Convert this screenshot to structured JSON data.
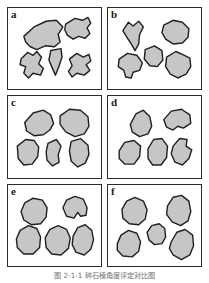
{
  "figure": {
    "title_label": "Roundness / angularity comparison chart",
    "caption": "图 2-1-1  碎石棱角度评定对比图",
    "panel_count": 6,
    "colors": {
      "grain_fill": "#c6c6c6",
      "grain_stroke": "#1f1f1f",
      "panel_border": "#2b2b2b",
      "background": "#ffffff",
      "label_color": "#1a1a1a",
      "caption_color": "#6e6e6e"
    }
  },
  "panels": [
    {
      "id": "a",
      "label": "a",
      "class_name": "very-angular",
      "grain_count": 5,
      "grains": [
        {
          "name": "grain-a1",
          "points": "17,30 28,20 41,14 52,13 59,20 54,28 56,36 50,41 40,40 31,44 24,41 19,36"
        },
        {
          "name": "grain-a2",
          "points": "62,17 72,11 80,13 86,10 89,16 85,21 88,27 83,32 76,30 70,33 64,29 61,23"
        },
        {
          "name": "grain-a3",
          "points": "14,54 21,47 27,50 31,46 36,52 33,59 38,64 35,71 27,69 22,74 17,69 19,62 13,60"
        },
        {
          "name": "grain-a4",
          "points": "46,45 57,43 58,52 55,61 51,71 47,62 44,55"
        },
        {
          "name": "grain-a5",
          "points": "66,54 74,48 81,52 87,49 89,56 84,60 88,66 82,71 74,69 69,73 65,67 69,61"
        }
      ]
    },
    {
      "id": "b",
      "label": "b",
      "class_name": "angular",
      "grain_count": 5,
      "grains": [
        {
          "name": "grain-b1",
          "points": "16,24 22,15 27,19 33,14 38,20 34,28 33,38 29,45 25,38 21,32"
        },
        {
          "name": "grain-b2",
          "points": "60,18 70,13 80,15 87,22 86,31 80,37 70,38 62,33 58,26"
        },
        {
          "name": "grain-b3",
          "points": "40,44 50,40 58,45 59,55 53,62 45,61 39,54"
        },
        {
          "name": "grain-b4",
          "points": "12,54 21,48 31,50 37,58 34,66 27,68 25,74 19,73 17,66 11,62"
        },
        {
          "name": "grain-b5",
          "points": "63,52 73,46 80,49 88,53 89,62 84,70 75,74 67,70 62,62"
        }
      ]
    },
    {
      "id": "c",
      "label": "c",
      "class_name": "subangular",
      "grain_count": 5,
      "grains": [
        {
          "name": "grain-c1",
          "points": "18,28 27,18 38,15 46,20 49,29 45,36 38,41 28,42 20,37"
        },
        {
          "name": "grain-c2",
          "points": "56,21 66,14 78,15 86,22 87,32 82,40 72,43 62,38 56,30"
        },
        {
          "name": "grain-c3",
          "points": "10,53 19,46 28,47 33,54 32,64 26,72 17,73 11,66"
        },
        {
          "name": "grain-c4",
          "points": "43,50 52,46 57,53 54,62 55,70 48,74 42,68 41,59"
        },
        {
          "name": "grain-c5",
          "points": "68,48 78,45 86,52 87,62 83,71 75,75 68,69 66,58"
        }
      ]
    },
    {
      "id": "d",
      "label": "d",
      "class_name": "subrounded",
      "grain_count": 5,
      "grains": [
        {
          "name": "grain-d1",
          "points": "24,30 30,19 38,15 45,22 47,32 43,40 34,43 26,38"
        },
        {
          "name": "grain-d2",
          "points": "60,25 68,16 79,14 88,20 89,29 81,34 75,32 70,36 63,33"
        },
        {
          "name": "grain-d3",
          "points": "12,58 18,49 28,47 35,53 34,64 28,72 18,72 12,66"
        },
        {
          "name": "grain-d4",
          "points": "43,56 49,46 58,45 64,53 63,65 57,73 48,73 43,66"
        },
        {
          "name": "grain-d5",
          "points": "70,53 77,45 85,46 84,53 90,57 87,66 80,73 72,70 68,61"
        }
      ]
    },
    {
      "id": "e",
      "label": "e",
      "class_name": "rounded",
      "grain_count": 5,
      "grains": [
        {
          "name": "grain-e1",
          "points": "14,28 18,19 27,14 37,16 42,24 41,34 35,41 25,42 17,37"
        },
        {
          "name": "grain-e2",
          "points": "59,24 63,16 72,12 81,15 85,24 84,32 78,33 75,29 71,35 63,33"
        },
        {
          "name": "grain-e3",
          "points": "9,57 13,48 22,43 31,46 35,55 34,66 27,73 17,73 10,66"
        },
        {
          "name": "grain-e4",
          "points": "40,56 45,47 54,43 63,47 67,56 65,67 57,74 47,73 41,66"
        },
        {
          "name": "grain-e5",
          "points": "70,54 75,45 83,42 90,48 92,58 89,68 82,74 73,71 69,63"
        }
      ]
    },
    {
      "id": "f",
      "label": "f",
      "class_name": "well-rounded",
      "grain_count": 5,
      "grains": [
        {
          "name": "grain-f1",
          "points": "15,26 20,17 29,13 38,17 42,26 40,36 33,42 23,41 16,35"
        },
        {
          "name": "grain-f2",
          "points": "64,22 70,13 79,11 87,17 89,28 86,38 78,43 69,39 63,31"
        },
        {
          "name": "grain-f3",
          "points": "42,50 47,43 55,41 61,46 62,55 58,62 50,63 44,58"
        },
        {
          "name": "grain-f4",
          "points": "10,62 14,53 22,48 31,51 35,60 33,70 26,76 16,75 10,69"
        },
        {
          "name": "grain-f5",
          "points": "68,60 74,50 83,47 91,53 92,64 88,74 79,79 70,74 66,67"
        }
      ]
    }
  ]
}
